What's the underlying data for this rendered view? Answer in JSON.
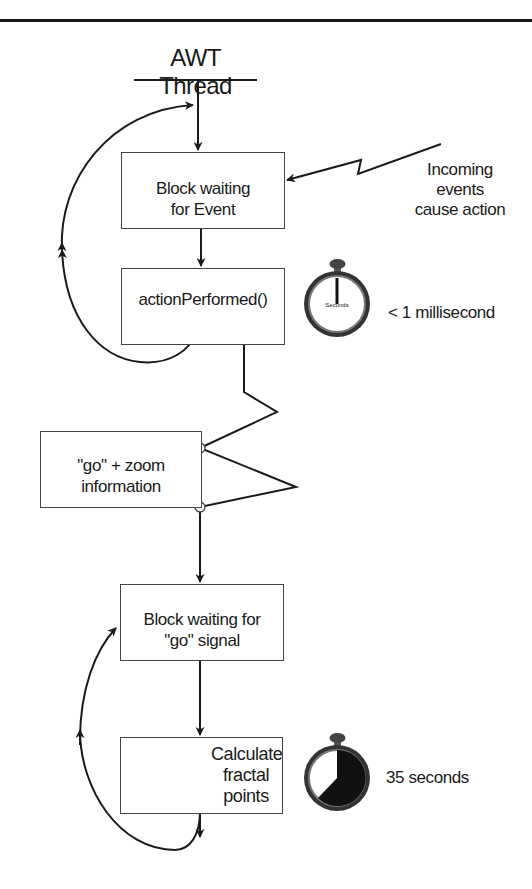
{
  "diagram": {
    "title": "AWT Thread",
    "boxes": {
      "block_event": "Block waiting for Event",
      "action_performed": "actionPerformed()",
      "go_zoom": "\"go\" + zoom information",
      "block_go": "Block waiting for \"go\" signal",
      "calculate": "Calculate fractal points"
    },
    "labels": {
      "incoming": [
        "Incoming",
        "events",
        "cause action"
      ],
      "fast_time": "< 1 millisecond",
      "slow_time": "35 seconds"
    },
    "icons": {
      "stopwatch_fast": "stopwatch-icon",
      "stopwatch_slow": "stopwatch-icon",
      "gears": "gears-icon"
    },
    "colors": {
      "ink": "#1a1a1a",
      "box_border": "#444444",
      "background": "#ffffff"
    }
  }
}
